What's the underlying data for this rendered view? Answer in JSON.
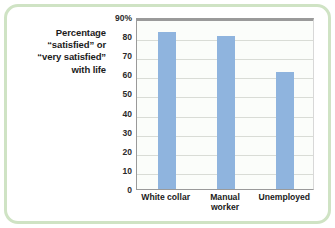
{
  "figure": {
    "frame_color": "#cfe3c4",
    "background": "#ffffff"
  },
  "axis_caption": {
    "line1": "Percentage",
    "line2": "“satisfied” or",
    "line3": "“very satisfied”",
    "line4": "with life"
  },
  "chart_data": {
    "type": "bar",
    "title": "",
    "subtitle": "",
    "xlabel": "",
    "ylabel": "Percentage “satisfied” or “very satisfied” with life",
    "categories": [
      "White collar",
      "Manual worker",
      "Unemployed"
    ],
    "category_labels_multiline": [
      "White collar",
      "Manual\nworker",
      "Unemployed"
    ],
    "values": [
      82,
      80,
      61
    ],
    "series": [
      {
        "name": "Percentage satisfied or very satisfied with life",
        "values": [
          82,
          80,
          61
        ],
        "color": "#8fb4de"
      }
    ],
    "ylim": [
      0,
      90
    ],
    "ytick_values": [
      0,
      10,
      20,
      30,
      40,
      50,
      60,
      70,
      80,
      90
    ],
    "ytick_labels": [
      "0",
      "10",
      "20",
      "30",
      "40",
      "50",
      "60",
      "70",
      "80",
      "90%"
    ],
    "grid": true,
    "grid_axis": "y",
    "legend": false,
    "legend_position": "none",
    "bar_color": "#8fb4de",
    "gridline_color": "#d9dcd6",
    "plot_background": "#fbfdfa",
    "axis_line_color": "#9a9a9a"
  }
}
